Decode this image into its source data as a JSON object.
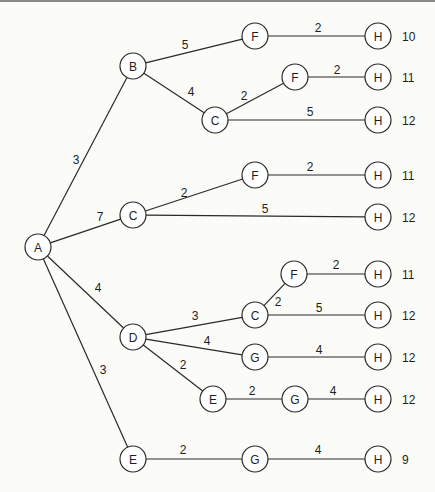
{
  "diagram": {
    "type": "tree",
    "style": {
      "line_color": "#2a2a2a",
      "node_fill": "#ffffff",
      "background": "#fbfbf8",
      "node_radius": 13
    },
    "nodes": [
      {
        "id": "A",
        "label": "A",
        "x": 38,
        "y": 247
      },
      {
        "id": "B",
        "label": "B",
        "x": 133,
        "y": 66
      },
      {
        "id": "F1",
        "label": "F",
        "x": 255,
        "y": 36
      },
      {
        "id": "H1",
        "label": "H",
        "x": 378,
        "y": 36
      },
      {
        "id": "C1",
        "label": "C",
        "x": 215,
        "y": 120
      },
      {
        "id": "F2",
        "label": "F",
        "x": 295,
        "y": 77
      },
      {
        "id": "H2",
        "label": "H",
        "x": 378,
        "y": 77
      },
      {
        "id": "H3",
        "label": "H",
        "x": 378,
        "y": 120
      },
      {
        "id": "C2",
        "label": "C",
        "x": 133,
        "y": 215
      },
      {
        "id": "F3",
        "label": "F",
        "x": 255,
        "y": 175
      },
      {
        "id": "H4",
        "label": "H",
        "x": 378,
        "y": 175
      },
      {
        "id": "H5",
        "label": "H",
        "x": 378,
        "y": 217
      },
      {
        "id": "D",
        "label": "D",
        "x": 133,
        "y": 337
      },
      {
        "id": "C3",
        "label": "C",
        "x": 255,
        "y": 315
      },
      {
        "id": "F4",
        "label": "F",
        "x": 294,
        "y": 274
      },
      {
        "id": "H6",
        "label": "H",
        "x": 378,
        "y": 274
      },
      {
        "id": "H7",
        "label": "H",
        "x": 378,
        "y": 315
      },
      {
        "id": "G1",
        "label": "G",
        "x": 255,
        "y": 357
      },
      {
        "id": "H8",
        "label": "H",
        "x": 378,
        "y": 357
      },
      {
        "id": "E1",
        "label": "E",
        "x": 213,
        "y": 399
      },
      {
        "id": "G2",
        "label": "G",
        "x": 295,
        "y": 399
      },
      {
        "id": "H9",
        "label": "H",
        "x": 378,
        "y": 399
      },
      {
        "id": "E2",
        "label": "E",
        "x": 133,
        "y": 459
      },
      {
        "id": "G3",
        "label": "G",
        "x": 255,
        "y": 459
      },
      {
        "id": "H10",
        "label": "H",
        "x": 378,
        "y": 459
      }
    ],
    "edges": [
      {
        "from": "A",
        "to": "B",
        "weight": "3",
        "lx": 76,
        "ly": 160
      },
      {
        "from": "A",
        "to": "C2",
        "weight": "7",
        "lx": 100,
        "ly": 217
      },
      {
        "from": "A",
        "to": "D",
        "weight": "4",
        "lx": 98,
        "ly": 288
      },
      {
        "from": "A",
        "to": "E2",
        "weight": "3",
        "lx": 103,
        "ly": 370
      },
      {
        "from": "B",
        "to": "F1",
        "weight": "5",
        "lx": 185,
        "ly": 45
      },
      {
        "from": "B",
        "to": "C1",
        "weight": "4",
        "lx": 191,
        "ly": 92
      },
      {
        "from": "F1",
        "to": "H1",
        "weight": "2",
        "lx": 318,
        "ly": 28
      },
      {
        "from": "C1",
        "to": "F2",
        "weight": "2",
        "lx": 244,
        "ly": 96
      },
      {
        "from": "F2",
        "to": "H2",
        "weight": "2",
        "lx": 337,
        "ly": 70
      },
      {
        "from": "C1",
        "to": "H3",
        "weight": "5",
        "lx": 310,
        "ly": 112
      },
      {
        "from": "C2",
        "to": "F3",
        "weight": "2",
        "lx": 184,
        "ly": 193
      },
      {
        "from": "F3",
        "to": "H4",
        "weight": "2",
        "lx": 310,
        "ly": 167
      },
      {
        "from": "C2",
        "to": "H5",
        "weight": "5",
        "lx": 265,
        "ly": 209
      },
      {
        "from": "D",
        "to": "C3",
        "weight": "3",
        "lx": 195,
        "ly": 316
      },
      {
        "from": "C3",
        "to": "F4",
        "weight": "2",
        "lx": 278,
        "ly": 302
      },
      {
        "from": "F4",
        "to": "H6",
        "weight": "2",
        "lx": 336,
        "ly": 265
      },
      {
        "from": "C3",
        "to": "H7",
        "weight": "5",
        "lx": 319,
        "ly": 308
      },
      {
        "from": "D",
        "to": "G1",
        "weight": "4",
        "lx": 207,
        "ly": 341
      },
      {
        "from": "G1",
        "to": "H8",
        "weight": "4",
        "lx": 319,
        "ly": 350
      },
      {
        "from": "D",
        "to": "E1",
        "weight": "2",
        "lx": 183,
        "ly": 365
      },
      {
        "from": "E1",
        "to": "G2",
        "weight": "2",
        "lx": 252,
        "ly": 391
      },
      {
        "from": "G2",
        "to": "H9",
        "weight": "4",
        "lx": 333,
        "ly": 391
      },
      {
        "from": "E2",
        "to": "G3",
        "weight": "2",
        "lx": 183,
        "ly": 450
      },
      {
        "from": "G3",
        "to": "H10",
        "weight": "4",
        "lx": 318,
        "ly": 450
      }
    ],
    "path_totals": [
      {
        "node": "H1",
        "value": "10"
      },
      {
        "node": "H2",
        "value": "11"
      },
      {
        "node": "H3",
        "value": "12"
      },
      {
        "node": "H4",
        "value": "11"
      },
      {
        "node": "H5",
        "value": "12"
      },
      {
        "node": "H6",
        "value": "11"
      },
      {
        "node": "H7",
        "value": "12"
      },
      {
        "node": "H8",
        "value": "12"
      },
      {
        "node": "H9",
        "value": "12"
      },
      {
        "node": "H10",
        "value": "9"
      }
    ]
  }
}
